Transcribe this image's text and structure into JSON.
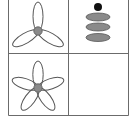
{
  "diagram": {
    "type": "2x2 figure grid",
    "grid_color": "#6b6b6b",
    "outline_color": "#555555",
    "fill_gray": "#8a8a8a",
    "dot_color": "#111111",
    "cells": [
      {
        "position": "top-left",
        "figure": "three-petal-propeller",
        "petals": 3
      },
      {
        "position": "top-right",
        "figure": "dot-over-three-stacked-ellipses",
        "ellipses": 3
      },
      {
        "position": "bottom-left",
        "figure": "five-petal-flower",
        "petals": 5
      },
      {
        "position": "bottom-right",
        "figure": "empty",
        "petals": 0
      }
    ]
  }
}
